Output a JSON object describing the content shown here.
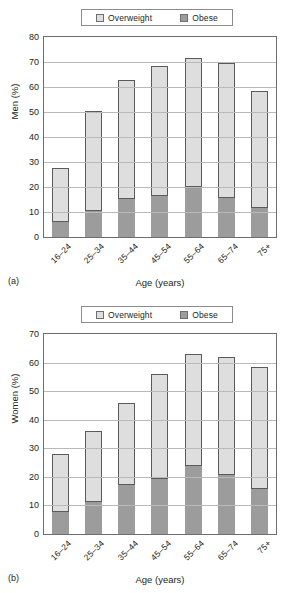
{
  "legend": {
    "items": [
      {
        "label": "Overweight",
        "color": "#dedede",
        "icon": "legend-swatch-overweight"
      },
      {
        "label": "Obese",
        "color": "#9c9c9c",
        "icon": "legend-swatch-obese"
      }
    ]
  },
  "panels": [
    {
      "caption": "(a)"
    },
    {
      "caption": "(b)"
    }
  ],
  "chart_data": [
    {
      "type": "bar",
      "subtype": "stacked",
      "panel": "(a)",
      "title": "",
      "xlabel": "Age (years)",
      "ylabel": "Men (%)",
      "categories": [
        "16–24",
        "25–34",
        "35–44",
        "45–54",
        "55–64",
        "65–74",
        "75+"
      ],
      "ylim": [
        0,
        80
      ],
      "yticks": [
        0,
        10,
        20,
        30,
        40,
        50,
        60,
        70,
        80
      ],
      "grid": true,
      "legend_position": "top",
      "series": [
        {
          "name": "Obese",
          "color": "#9c9c9c",
          "values": [
            6.5,
            11,
            15.5,
            17,
            20.5,
            16,
            12
          ]
        },
        {
          "name": "Overweight",
          "color": "#dedede",
          "values": [
            21,
            39.5,
            47.5,
            51.5,
            51,
            53.5,
            46.5
          ]
        }
      ],
      "totals": [
        27.5,
        50.5,
        63,
        68.5,
        71.5,
        69.5,
        58.5
      ]
    },
    {
      "type": "bar",
      "subtype": "stacked",
      "panel": "(b)",
      "title": "",
      "xlabel": "Age (years)",
      "ylabel": "Women (%)",
      "categories": [
        "16–24",
        "25–34",
        "35–44",
        "45–54",
        "55–64",
        "65–74",
        "75+"
      ],
      "ylim": [
        0,
        70
      ],
      "yticks": [
        0,
        10,
        20,
        30,
        40,
        50,
        60,
        70
      ],
      "grid": true,
      "legend_position": "top",
      "series": [
        {
          "name": "Obese",
          "color": "#9c9c9c",
          "values": [
            8,
            11.5,
            17.5,
            19.5,
            24,
            21,
            16
          ]
        },
        {
          "name": "Overweight",
          "color": "#dedede",
          "values": [
            20,
            24.5,
            28.5,
            36.5,
            39,
            41,
            42.5
          ]
        }
      ],
      "totals": [
        28,
        36,
        46,
        56,
        63,
        62,
        58.5
      ]
    }
  ]
}
